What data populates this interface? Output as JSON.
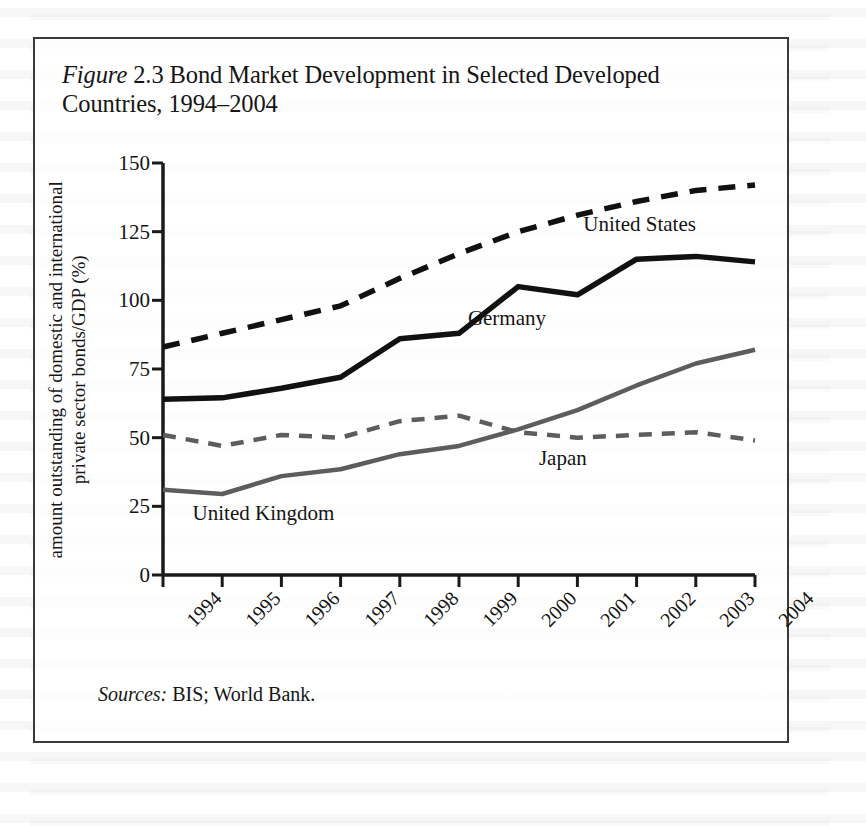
{
  "figure": {
    "title_prefix": "Figure",
    "title_number": "2.3",
    "title_rest": "Bond Market Development in Selected Developed Countries, 1994–2004",
    "source_label": "Sources:",
    "source_text": "BIS; World Bank."
  },
  "chart_data": {
    "type": "line",
    "title": "Figure 2.3 Bond Market Development in Selected Developed Countries, 1994–2004",
    "xlabel": "",
    "ylabel": "amount outstanding of domestic and international private sector bonds/GDP (%)",
    "categories": [
      "1994",
      "1995",
      "1996",
      "1997",
      "1998",
      "1999",
      "2000",
      "2001",
      "2002",
      "2003",
      "2004"
    ],
    "x": [
      1994,
      1995,
      1996,
      1997,
      1998,
      1999,
      2000,
      2001,
      2002,
      2003,
      2004
    ],
    "ylim": [
      0,
      150
    ],
    "yticks": [
      0,
      25,
      50,
      75,
      100,
      125,
      150
    ],
    "ytick_labels": [
      "0",
      "25",
      "50",
      "75",
      "100",
      "125",
      "150"
    ],
    "grid": false,
    "legend_position": "inline-annotations",
    "series": [
      {
        "name": "United States",
        "style": "dashed",
        "color": "#111111",
        "width": 5.5,
        "values": [
          83,
          88,
          93,
          98,
          108,
          117,
          125,
          131,
          136,
          140,
          142
        ],
        "label_x": 2001.1,
        "label_y": 127
      },
      {
        "name": "Germany",
        "style": "solid",
        "color": "#111111",
        "width": 5.5,
        "values": [
          64,
          64.5,
          68,
          72,
          86,
          88,
          105,
          102,
          115,
          116,
          114
        ],
        "label_x": 1999.15,
        "label_y": 93
      },
      {
        "name": "Japan",
        "style": "dashed",
        "color": "#5d5d5d",
        "width": 4.5,
        "values": [
          51,
          47,
          51,
          50,
          56,
          58,
          52,
          50,
          51,
          52,
          49
        ],
        "label_x": 2000.35,
        "label_y": 42
      },
      {
        "name": "United Kingdom",
        "style": "solid",
        "color": "#5d5d5d",
        "width": 4.5,
        "values": [
          31,
          29.5,
          36,
          38.5,
          44,
          47,
          53,
          60,
          69,
          77,
          82
        ],
        "label_x": 1994.5,
        "label_y": 22
      }
    ]
  }
}
